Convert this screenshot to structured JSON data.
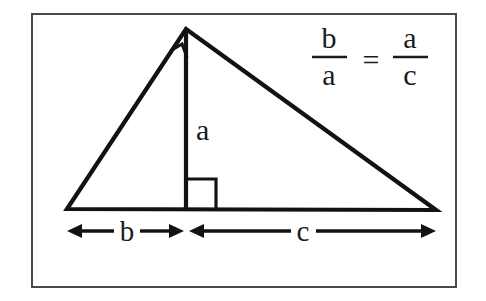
{
  "figure": {
    "kind": "geometry-diagram",
    "background_color": "#ffffff",
    "ink_color": "#121212",
    "frame_color": "#4a4a4a",
    "frame": {
      "x": 31,
      "y": 13,
      "width": 425,
      "height": 274
    }
  },
  "labels": {
    "altitude": "a",
    "left_segment": "b",
    "right_segment": "c"
  },
  "formula": {
    "left_numerator": "b",
    "left_denominator": "a",
    "relation": "=",
    "right_numerator": "a",
    "right_denominator": "c",
    "plain_text": "b/a = a/c"
  },
  "geometry": {
    "apex": {
      "x": 186,
      "y": 29
    },
    "left_vertex": {
      "x": 67,
      "y": 209
    },
    "right_vertex": {
      "x": 436,
      "y": 210
    },
    "altitude_foot": {
      "x": 186,
      "y": 209
    },
    "apex_right_angle": true,
    "base_right_angle": true
  },
  "dimensions": {
    "b_arrow": {
      "x_start": 68,
      "x_end": 183,
      "y": 231,
      "label": "b"
    },
    "c_arrow": {
      "x_start": 189,
      "x_end": 436,
      "y": 231,
      "label": "c"
    }
  }
}
